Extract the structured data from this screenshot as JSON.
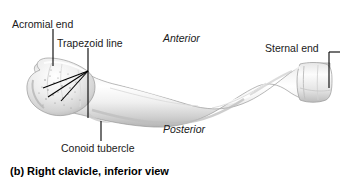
{
  "figure": {
    "caption": "(b) Right clavicle, inferior view",
    "subject": "right clavicle",
    "view": "inferior",
    "style": "grayscale anatomical illustration"
  },
  "labels": {
    "acromial_end": "Acromial end",
    "trapezoid_line": "Trapezoid line",
    "conoid_tubercle": "Conoid tubercle",
    "sternal_end": "Sternal end"
  },
  "orientation": {
    "anterior": "Anterior",
    "posterior": "Posterior"
  },
  "colors": {
    "background": "#ffffff",
    "text": "#1a1a1a",
    "caption": "#000000",
    "leader_line": "#000000",
    "bone_light": "#fbfbfb",
    "bone_mid": "#e2e2e2",
    "bone_shadow": "#b8b8b8",
    "bone_outline": "#9a9a9a",
    "stipple": "#8f8f8f"
  }
}
